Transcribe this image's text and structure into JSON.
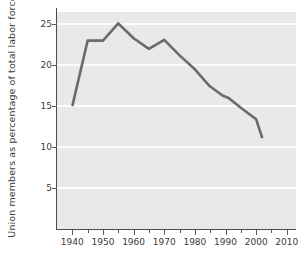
{
  "chart_data": {
    "type": "line",
    "title": "",
    "xlabel": "",
    "ylabel": "Union members as percentage of total labor force",
    "xlim": [
      1935,
      2013
    ],
    "ylim": [
      0,
      26.5
    ],
    "grid": true,
    "legend": false,
    "line_color": "#6b6b6b",
    "plot_background": "#e9e9e9",
    "gridline_color": "#fdfdfd",
    "xticks": [
      1940,
      1950,
      1960,
      1970,
      1980,
      1990,
      2000,
      2010
    ],
    "xtick_labels": [
      "1940",
      "1950",
      "1960",
      "1970",
      "1980",
      "1990",
      "2000",
      "2010"
    ],
    "xminor_ticks": [
      1945,
      1955,
      1965,
      1975,
      1985,
      1995,
      2005
    ],
    "yticks": [
      5,
      10,
      15,
      20,
      25
    ],
    "ytick_labels": [
      "5",
      "10",
      "15",
      "20",
      "25"
    ],
    "series": [
      {
        "name": "Union membership",
        "x": [
          1940,
          1945,
          1950,
          1955,
          1960,
          1965,
          1970,
          1975,
          1980,
          1983,
          1985,
          1989,
          1991,
          1995,
          2000,
          2002
        ],
        "values": [
          15.0,
          23.0,
          23.0,
          25.1,
          23.3,
          22.0,
          23.1,
          21.2,
          19.5,
          18.2,
          17.4,
          16.3,
          16.0,
          14.8,
          13.4,
          11.1
        ]
      }
    ]
  }
}
